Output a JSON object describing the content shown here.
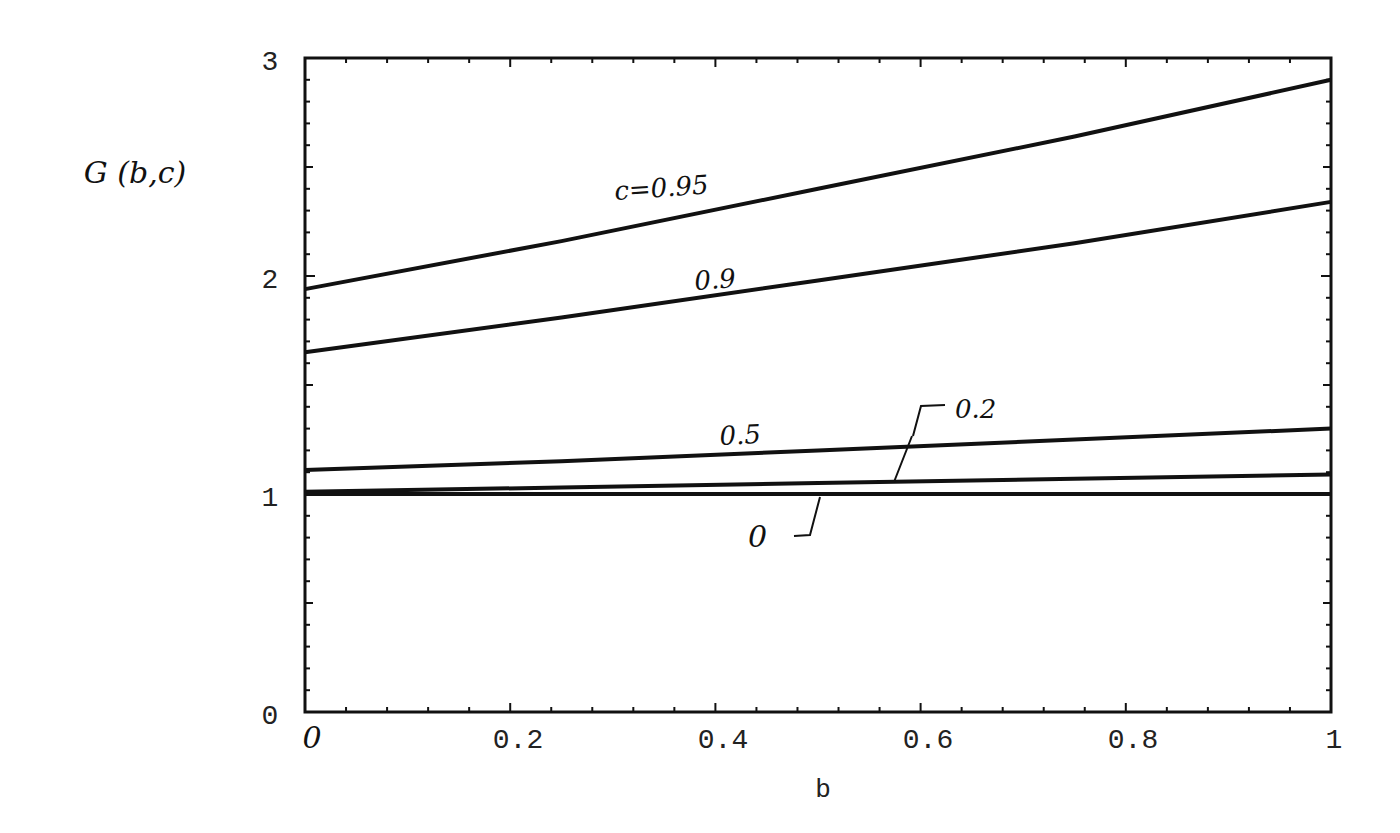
{
  "chart_data": {
    "type": "line",
    "title": "",
    "xlabel": "b",
    "ylabel": "G (b,c)",
    "xlim": [
      0,
      1
    ],
    "ylim": [
      0,
      3
    ],
    "grid": false,
    "legend": "inline hand-written labels",
    "x_ticks": [
      "0",
      "0.2",
      "0.4",
      "0.6",
      "0.8",
      "1"
    ],
    "y_ticks": [
      "0",
      "1",
      "2",
      "3"
    ],
    "x": [
      0,
      0.25,
      0.5,
      0.75,
      1.0
    ],
    "series": [
      {
        "name": "c=0.95",
        "label": "c=0.95",
        "values": [
          1.94,
          2.16,
          2.4,
          2.64,
          2.9
        ]
      },
      {
        "name": "c=0.9",
        "label": "0.9",
        "values": [
          1.65,
          1.81,
          1.98,
          2.15,
          2.34
        ]
      },
      {
        "name": "c=0.5",
        "label": "0.5",
        "values": [
          1.11,
          1.15,
          1.2,
          1.25,
          1.3
        ]
      },
      {
        "name": "c=0.2",
        "label": "0.2",
        "values": [
          1.01,
          1.03,
          1.05,
          1.07,
          1.09
        ]
      },
      {
        "name": "c=0",
        "label": "0",
        "values": [
          1.0,
          1.0,
          1.0,
          1.0,
          1.0
        ]
      }
    ]
  },
  "labels": {
    "ylabel": "G (b,c)",
    "xlabel": "b",
    "c095": "c=0.95",
    "c09": "0.9",
    "c05": "0.5",
    "c02": "0.2",
    "c0": "0",
    "xt0": "0",
    "xt1": "0.2",
    "xt2": "0.4",
    "xt3": "0.6",
    "xt4": "0.8",
    "xt5": "1",
    "yt0": "0",
    "yt1": "1",
    "yt2": "2",
    "yt3": "3"
  }
}
